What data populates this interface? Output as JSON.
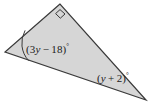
{
  "figure": {
    "type": "geometry-diagram",
    "shape": "triangle",
    "background_color": "#ffffff",
    "fill_color": "#d6d6d6",
    "stroke_color": "#3a3a3a",
    "vertices": [
      {
        "name": "top-vertex",
        "x": 60,
        "y": 4
      },
      {
        "name": "left-vertex",
        "x": 5,
        "y": 52
      },
      {
        "name": "right-vertex",
        "x": 146,
        "y": 100
      }
    ],
    "markers": [
      {
        "name": "right-angle-square",
        "at_vertex": "top-vertex",
        "kind": "square"
      },
      {
        "name": "angle-arc",
        "at_vertex": "left-vertex",
        "kind": "arc"
      }
    ],
    "labels": {
      "left_angle": {
        "full_text": "(3y − 18)°",
        "open_paren": "(",
        "coefficient": "3",
        "variable": "y",
        "operator": "−",
        "constant": "18",
        "close_paren": ")",
        "degree": "°"
      },
      "right_angle": {
        "full_text": "(y + 2)°",
        "open_paren": "(",
        "variable": "y",
        "operator": "+",
        "constant": "2",
        "close_paren": ")",
        "degree": "°"
      }
    }
  }
}
